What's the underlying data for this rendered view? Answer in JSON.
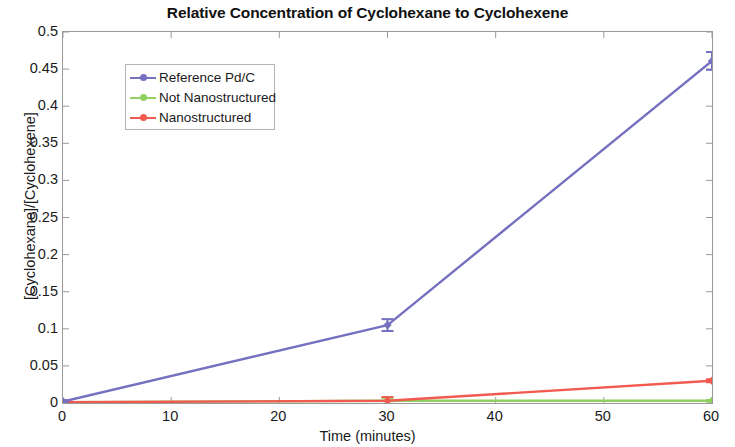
{
  "chart_data": {
    "type": "line",
    "title": "Relative Concentration of Cyclohexane to Cyclohexene",
    "xlabel": "Time (minutes)",
    "ylabel": "[Cyclohexane]/[Cyclohexene]",
    "xlim": [
      0,
      60
    ],
    "ylim": [
      0,
      0.5
    ],
    "xticks": [
      0,
      10,
      20,
      30,
      40,
      50,
      60
    ],
    "xticklabels": [
      "0",
      "10",
      "20",
      "30",
      "40",
      "50",
      "60"
    ],
    "yticks": [
      0,
      0.05,
      0.1,
      0.15,
      0.2,
      0.25,
      0.3,
      0.35,
      0.4,
      0.45,
      0.5
    ],
    "yticklabels": [
      "0",
      "0.05",
      "0.1",
      "0.15",
      "0.2",
      "0.25",
      "0.3",
      "0.35",
      "0.4",
      "0.45",
      "0.5"
    ],
    "grid": false,
    "legend_position": "upper left",
    "x": [
      0,
      30,
      60
    ],
    "series": [
      {
        "name": "Reference Pd/C",
        "color": "#7570c0",
        "values": [
          0.002,
          0.105,
          0.461
        ],
        "errors": [
          0.002,
          0.008,
          0.012
        ],
        "marker": "diamond"
      },
      {
        "name": "Not Nanostructured",
        "color": "#90d060",
        "values": [
          0.001,
          0.003,
          0.003
        ],
        "errors": [
          0.001,
          0.004,
          0.001
        ],
        "marker": "diamond"
      },
      {
        "name": "Nanostructured",
        "color": "#f05a50",
        "values": [
          0.001,
          0.003,
          0.03
        ],
        "errors": [
          0.002,
          0.005,
          0.002
        ],
        "marker": "diamond"
      }
    ]
  },
  "legend": {
    "items": [
      {
        "label": "Reference Pd/C"
      },
      {
        "label": "Not Nanostructured"
      },
      {
        "label": "Nanostructured"
      }
    ]
  }
}
